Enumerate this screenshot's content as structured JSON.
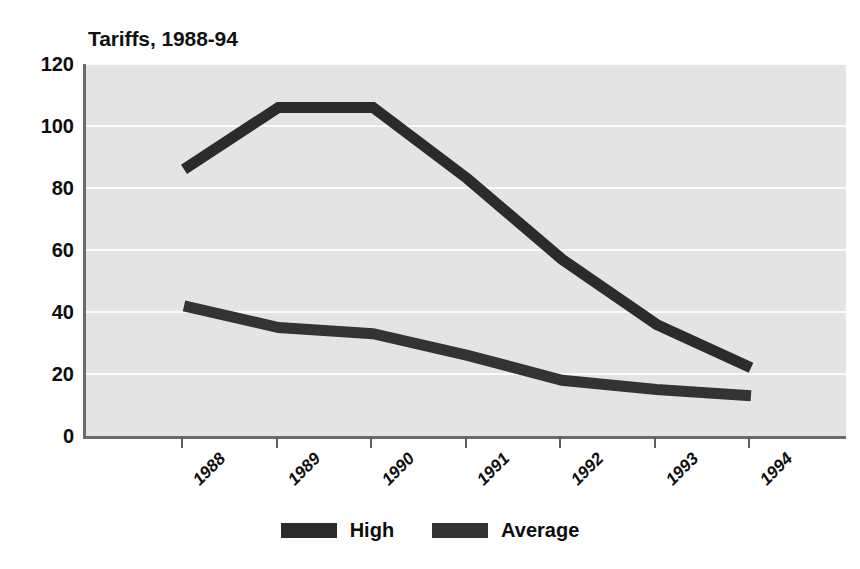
{
  "chart_data": {
    "type": "line",
    "title": "Tariffs, 1988-94",
    "xlabel": "",
    "ylabel": "",
    "categories": [
      "1988",
      "1989",
      "1990",
      "1991",
      "1992",
      "1993",
      "1994"
    ],
    "series": [
      {
        "name": "High",
        "color": "#2b2b2b",
        "values": [
          86,
          106,
          106,
          83,
          57,
          36,
          22
        ]
      },
      {
        "name": "Average",
        "color": "#333333",
        "values": [
          42,
          35,
          33,
          26,
          18,
          15,
          13
        ]
      }
    ],
    "ylim": [
      0,
      120
    ],
    "yticks": [
      0,
      20,
      40,
      60,
      80,
      100,
      120
    ],
    "ytick_labels": [
      "0",
      "20",
      "40",
      "60",
      "80",
      "100",
      "120"
    ],
    "grid": true,
    "grid_color": "#fbfbfb",
    "plot_background": "#e4e4e4",
    "legend_position": "bottom-center",
    "xtick_label_rotation": -45
  },
  "legend": {
    "entries": [
      {
        "label": "High",
        "color": "#2b2b2b"
      },
      {
        "label": "Average",
        "color": "#333333"
      }
    ]
  }
}
